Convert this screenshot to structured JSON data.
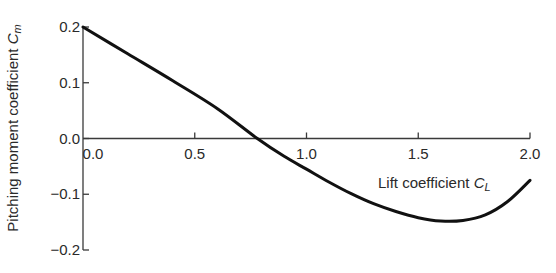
{
  "chart_data": {
    "type": "line",
    "title": "",
    "xlabel": "Lift coefficient",
    "xlabel_symbol": "C",
    "xlabel_subscript": "L",
    "ylabel": "Pitching moment coefficient",
    "ylabel_symbol": "C",
    "ylabel_subscript": "m",
    "xlim": [
      0.0,
      2.0
    ],
    "ylim": [
      -0.2,
      0.2
    ],
    "xticks": [
      0.0,
      0.5,
      1.0,
      1.5,
      2.0
    ],
    "xtick_labels": [
      "0.0",
      "0.5",
      "1.0",
      "1.5",
      "2.0"
    ],
    "yticks": [
      -0.2,
      -0.1,
      0.0,
      0.1,
      0.2
    ],
    "ytick_labels": [
      "-0.2",
      "-0.1",
      "0.0",
      "0.1",
      "0.2"
    ],
    "grid": false,
    "legend": null,
    "x_axis_at_y": 0.0,
    "series": [
      {
        "name": "Cm vs CL",
        "color": "#111111",
        "x": [
          0.0,
          0.2,
          0.4,
          0.6,
          0.78,
          0.9,
          1.0,
          1.1,
          1.2,
          1.3,
          1.4,
          1.5,
          1.6,
          1.7,
          1.8,
          1.9,
          2.0
        ],
        "y": [
          0.2,
          0.152,
          0.104,
          0.054,
          0.0,
          -0.032,
          -0.055,
          -0.078,
          -0.099,
          -0.117,
          -0.131,
          -0.142,
          -0.148,
          -0.147,
          -0.137,
          -0.113,
          -0.075
        ]
      }
    ]
  }
}
